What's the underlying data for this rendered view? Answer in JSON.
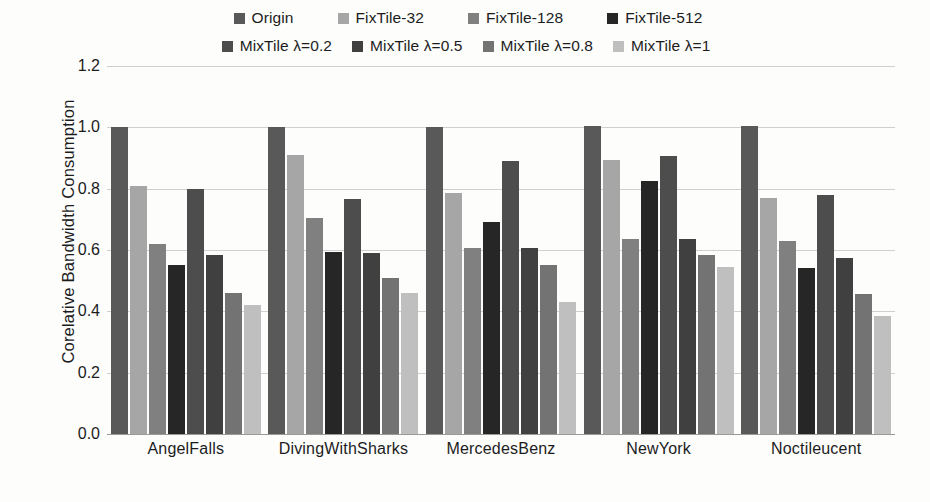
{
  "chart_data": {
    "type": "bar",
    "title": "",
    "xlabel": "",
    "ylabel": "Corelative Bandwidth Consumption",
    "ylim": [
      0.0,
      1.2
    ],
    "ytick_labels": [
      "1.2",
      "1.0",
      "0.8",
      "0.6",
      "0.4",
      "0.2",
      "0.0"
    ],
    "ytick_values": [
      1.2,
      1.0,
      0.8,
      0.6,
      0.4,
      0.2,
      0.0
    ],
    "grid": true,
    "legend_position": "top",
    "categories": [
      "AngelFalls",
      "DivingWithSharks",
      "MercedesBenz",
      "NewYork",
      "Noctileucent"
    ],
    "series": [
      {
        "name": "Origin",
        "color": "#595959",
        "values": [
          1.0,
          1.0,
          1.0,
          1.005,
          1.005
        ]
      },
      {
        "name": "FixTile-32",
        "color": "#a6a6a6",
        "values": [
          0.81,
          0.91,
          0.785,
          0.895,
          0.77
        ]
      },
      {
        "name": "FixTile-128",
        "color": "#808080",
        "values": [
          0.62,
          0.705,
          0.605,
          0.635,
          0.63
        ]
      },
      {
        "name": "FixTile-512",
        "color": "#262626",
        "values": [
          0.55,
          0.595,
          0.69,
          0.825,
          0.54
        ]
      },
      {
        "name": "MixTile λ=0.2",
        "color": "#4d4d4d",
        "values": [
          0.8,
          0.765,
          0.89,
          0.905,
          0.78
        ]
      },
      {
        "name": "MixTile λ=0.5",
        "color": "#404040",
        "values": [
          0.585,
          0.59,
          0.605,
          0.635,
          0.575
        ]
      },
      {
        "name": "MixTile λ=0.8",
        "color": "#737373",
        "values": [
          0.46,
          0.51,
          0.55,
          0.585,
          0.455
        ]
      },
      {
        "name": "MixTile λ=1",
        "color": "#bfbfbf",
        "values": [
          0.42,
          0.46,
          0.43,
          0.545,
          0.385
        ]
      }
    ]
  },
  "legend": {
    "row1": [
      "Origin",
      "FixTile-32",
      "FixTile-128",
      "FixTile-512"
    ],
    "row2": [
      "MixTile λ=0.2",
      "MixTile λ=0.5",
      "MixTile λ=0.8",
      "MixTile λ=1"
    ]
  }
}
